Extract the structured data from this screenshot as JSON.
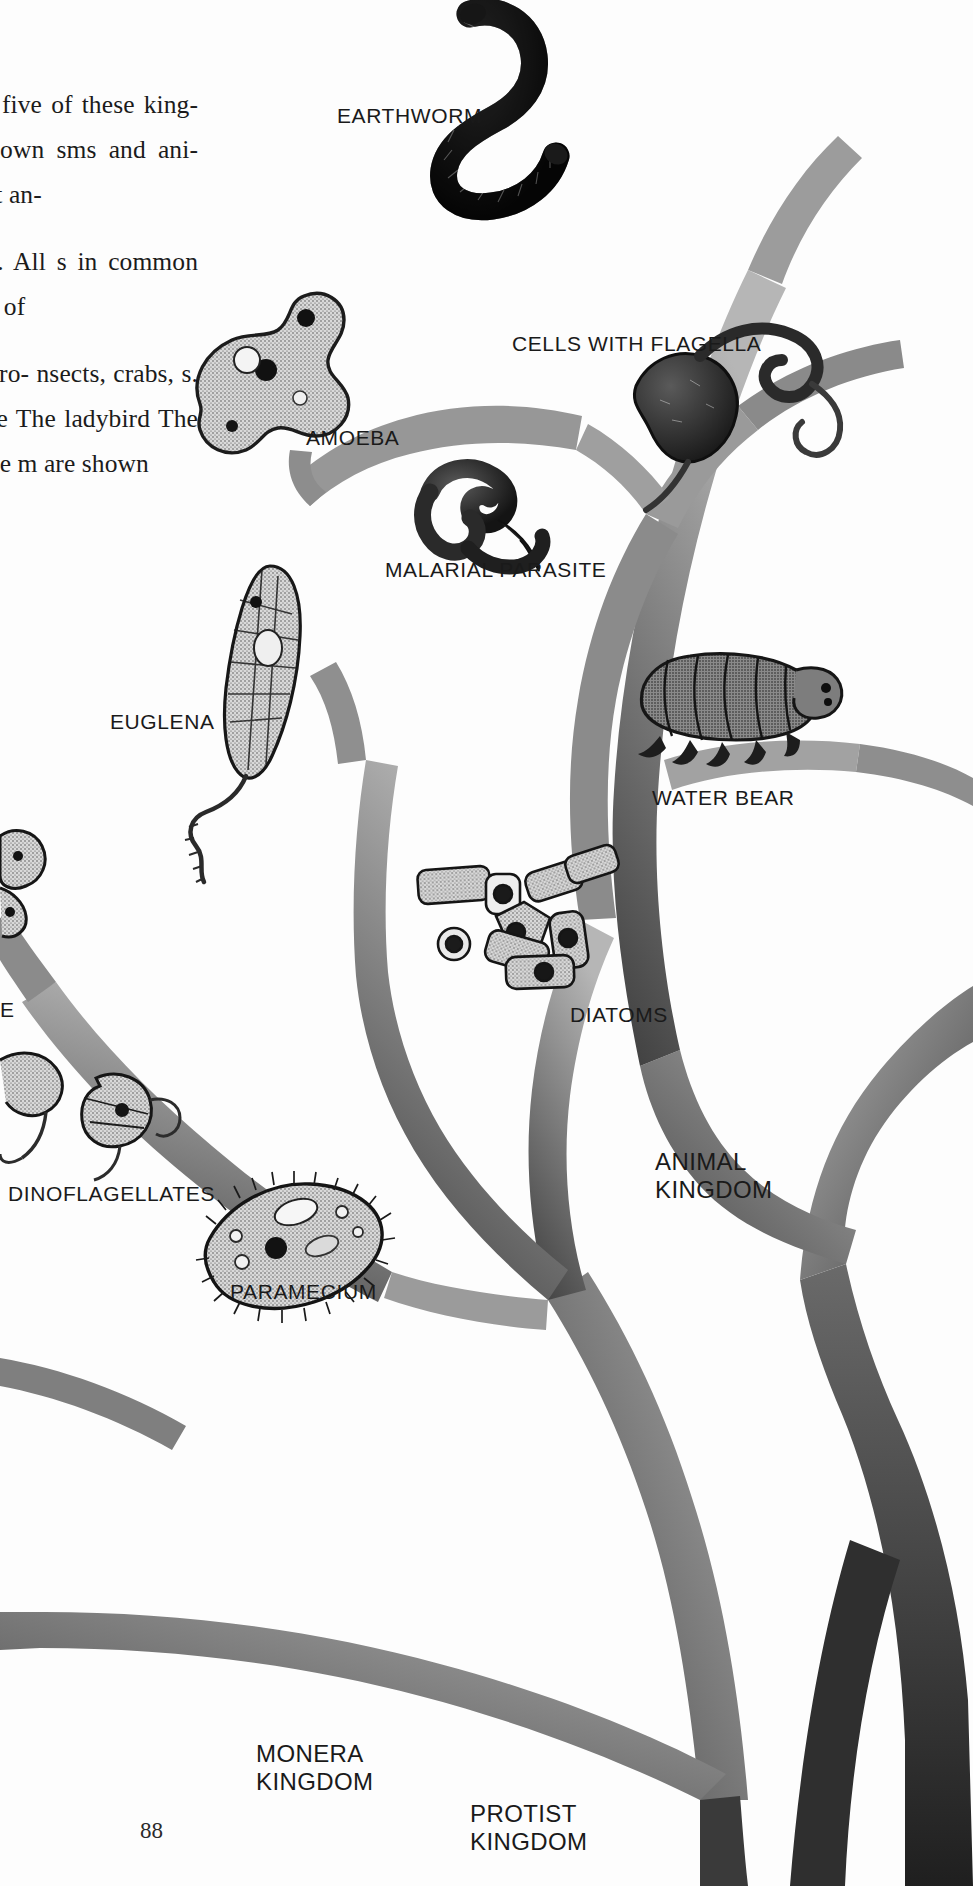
{
  "page": {
    "folio": "88",
    "domain_note": "book page spread: tree of life diagram"
  },
  "body_text": {
    "paragraphs": [
      "ngs into five of these king- —are shown sms and ani- tes. Most an-",
      "r groups. All s in common one kind of",
      "her. Arthro- nsects, crabs, s. There are The ladybird The rest of the m are shown"
    ],
    "lines": [
      "ngs into five",
      "f these king-",
      "—are shown",
      "sms and ani-",
      "tes. Most an-",
      "r groups. All",
      "s in common",
      "one kind of",
      "her. Arthro-",
      "nsects, crabs,",
      "s. There are",
      "The ladybird",
      "The rest of the",
      "m are shown"
    ]
  },
  "labels": [
    {
      "id": "earthworm",
      "text": "EARTHWORM",
      "x": 337,
      "y": 104,
      "lines": 1
    },
    {
      "id": "cells-with-flagella",
      "text": "CELLS WITH FLAGELLA",
      "x": 512,
      "y": 332,
      "lines": 1
    },
    {
      "id": "amoeba",
      "text": "AMOEBA",
      "x": 306,
      "y": 426,
      "lines": 1
    },
    {
      "id": "malarial-parasite",
      "text": "MALARIAL PARASITE",
      "x": 385,
      "y": 558,
      "lines": 1
    },
    {
      "id": "euglena",
      "text": "EUGLENA",
      "x": 110,
      "y": 710,
      "lines": 1
    },
    {
      "id": "water-bear",
      "text": "WATER BEAR",
      "x": 652,
      "y": 786,
      "lines": 1
    },
    {
      "id": "diatoms",
      "text": "DIATOMS",
      "x": 570,
      "y": 1003,
      "lines": 1
    },
    {
      "id": "dinoflagellates",
      "text": "DINOFLAGELLATES",
      "x": 8,
      "y": 1182,
      "lines": 1
    },
    {
      "id": "paramecium",
      "text": "PARAMECIUM",
      "x": 230,
      "y": 1280,
      "lines": 1
    },
    {
      "id": "sponge-partial",
      "text": "E",
      "x": 0,
      "y": 998,
      "lines": 1
    }
  ],
  "kingdom_labels": [
    {
      "id": "animal-kingdom",
      "line1": "ANIMAL",
      "line2": "KINGDOM",
      "x": 655,
      "y": 1148
    },
    {
      "id": "monera-kingdom",
      "line1": "MONERA",
      "line2": "KINGDOM",
      "x": 256,
      "y": 1740
    },
    {
      "id": "protist-kingdom",
      "line1": "PROTIST",
      "line2": "KINGDOM",
      "x": 470,
      "y": 1800
    }
  ],
  "colors": {
    "ink": "#1a1a1a",
    "paper": "#fdfdfd",
    "branch_light": "#8d8d8d",
    "branch_mid": "#6e6e6e",
    "branch_dark": "#3b3b3b",
    "trunk_dark": "#2b2b2b"
  },
  "organisms": [
    {
      "id": "earthworm",
      "kingdom": "Animal",
      "cx": 490,
      "cy": 100
    },
    {
      "id": "cells-with-flagella",
      "kingdom": "Protist",
      "cx": 700,
      "cy": 400
    },
    {
      "id": "amoeba",
      "kingdom": "Protist",
      "cx": 263,
      "cy": 395
    },
    {
      "id": "malarial-parasite",
      "kingdom": "Protist",
      "cx": 480,
      "cy": 510
    },
    {
      "id": "euglena",
      "kingdom": "Protist",
      "cx": 245,
      "cy": 680
    },
    {
      "id": "water-bear",
      "kingdom": "Animal",
      "cx": 700,
      "cy": 710
    },
    {
      "id": "diatoms",
      "kingdom": "Protist",
      "cx": 520,
      "cy": 915
    },
    {
      "id": "dinoflagellates",
      "kingdom": "Protist",
      "cx": 70,
      "cy": 1110
    },
    {
      "id": "paramecium",
      "kingdom": "Protist",
      "cx": 285,
      "cy": 1230
    },
    {
      "id": "sponge",
      "kingdom": "Animal",
      "cx": 5,
      "cy": 880
    }
  ]
}
